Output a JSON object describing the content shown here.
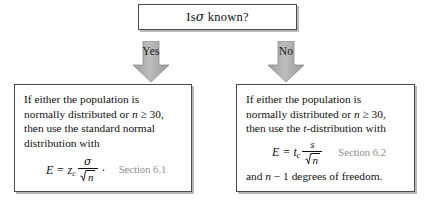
{
  "figure": {
    "type": "decision-flowchart",
    "topic": "Choosing a confidence interval formula for a population mean"
  },
  "decision": {
    "question_prefix": "Is",
    "question_symbol": "σ",
    "question_suffix": "known?"
  },
  "branches": {
    "yes": {
      "label": "Yes",
      "arrow": "down-arrow",
      "fill": "#a8a8a8"
    },
    "no": {
      "label": "No",
      "arrow": "down-arrow",
      "fill": "#a8a8a8"
    }
  },
  "known_box": {
    "lines": [
      "If either the population is",
      "normally distributed or n ≥ 30,",
      "then use the standard normal",
      "distribution with"
    ],
    "line2_plain_a": "normally distributed or ",
    "line2_italic": "n",
    "line2_plain_b": " ≥ 30,",
    "formula": {
      "lhs": "E",
      "equals": "=",
      "coefficient": "z",
      "coefficient_sub": "c",
      "numerator": "σ",
      "denominator_radicand": "n",
      "denominator": "√n",
      "trailing_punctuation": "·",
      "plain": "E = z_c σ/√n"
    },
    "section_ref": "Section 6.1"
  },
  "unknown_box": {
    "line1": "If either the population is",
    "line2_plain_a": "normally distributed or ",
    "line2_italic": "n",
    "line2_plain_b": " ≥ 30,",
    "line3_plain_a": "then use the ",
    "line3_italic": "t",
    "line3_plain_b": "-distribution with",
    "formula": {
      "lhs": "E",
      "equals": "=",
      "coefficient": "t",
      "coefficient_sub": "c",
      "numerator": "s",
      "denominator_radicand": "n",
      "denominator": "√n",
      "plain": "E = t_c s/√n"
    },
    "section_ref": "Section 6.2",
    "tail_plain_a": "and ",
    "tail_italic": "n",
    "tail_plain_b": " − 1 degrees of freedom."
  },
  "colors": {
    "box_border": "#4a4a4a",
    "box_shadow": "#b9b9b9",
    "arrow_fill": "#a8a8a8",
    "section_ref_text": "#8d8d8d",
    "body_text": "#111111",
    "background": "#ffffff"
  }
}
